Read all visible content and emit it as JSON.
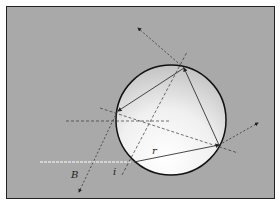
{
  "diagram": {
    "labels": {
      "beam": "B",
      "incidence": "i",
      "refraction": "r"
    },
    "colors": {
      "background": "#a9a9a9",
      "sphere_light": "#ffffff",
      "sphere_dark": "#c8c8c8",
      "lines": "#333333",
      "incident_ray": "#ffffff"
    }
  }
}
